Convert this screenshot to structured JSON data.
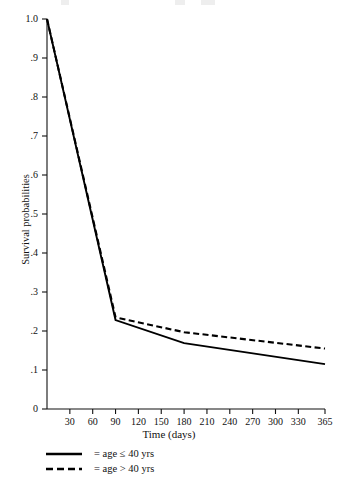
{
  "chart_data": {
    "type": "line",
    "title": "",
    "xlabel": "Time (days)",
    "ylabel": "Survival probabilities",
    "xlim": [
      0,
      365
    ],
    "ylim": [
      0,
      1.0
    ],
    "grid": false,
    "legend_position": "below-axis-left",
    "x_tick_labels": [
      "30",
      "60",
      "90",
      "120",
      "150",
      "180",
      "210",
      "240",
      "270",
      "300",
      "330",
      "365"
    ],
    "x_tick_values": [
      30,
      60,
      90,
      120,
      150,
      180,
      210,
      240,
      270,
      300,
      330,
      365
    ],
    "y_tick_labels": [
      "0",
      ".1",
      ".2",
      ".3",
      ".4",
      ".5",
      ".6",
      ".7",
      ".8",
      ".9",
      "1.0"
    ],
    "y_tick_values": [
      0,
      0.1,
      0.2,
      0.3,
      0.4,
      0.5,
      0.6,
      0.7,
      0.8,
      0.9,
      1.0
    ],
    "series": [
      {
        "name": "age ≤ 40 yrs",
        "style": "solid",
        "color": "#000000",
        "x": [
          0,
          90,
          180,
          365
        ],
        "values": [
          1.0,
          0.228,
          0.169,
          0.115
        ]
      },
      {
        "name": "age > 40 yrs",
        "style": "dashed",
        "color": "#000000",
        "x": [
          0,
          90,
          180,
          365
        ],
        "values": [
          1.0,
          0.235,
          0.197,
          0.155
        ]
      }
    ]
  },
  "axes": {
    "y_title": "Survival probabilities",
    "x_title": "Time (days)"
  },
  "legend": {
    "items": [
      {
        "label": "= age ≤ 40 yrs",
        "style": "solid"
      },
      {
        "label": "= age > 40 yrs",
        "style": "dashed"
      }
    ]
  }
}
